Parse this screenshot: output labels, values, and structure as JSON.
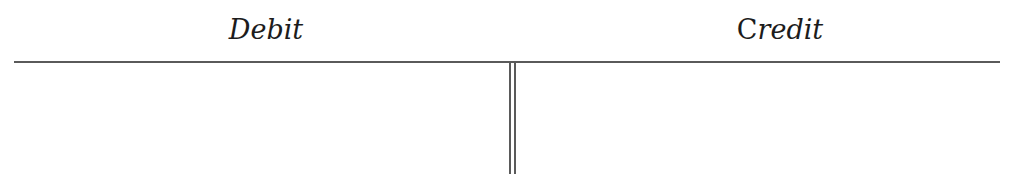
{
  "t_account": {
    "debit_label": "Debit",
    "credit_label_first": "C",
    "credit_label_rest": "redit",
    "debit_entries": [],
    "credit_entries": []
  },
  "colors": {
    "text": "#1c1c1c",
    "lines": "#5a5a5a",
    "background": "#ffffff"
  }
}
